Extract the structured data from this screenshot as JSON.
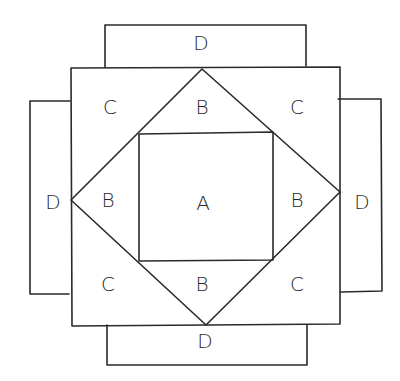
{
  "diagram": {
    "type": "quilt-block-layout",
    "labels": {
      "center": "A",
      "diamond_top": "B",
      "diamond_right": "B",
      "diamond_bottom": "B",
      "diamond_left": "B",
      "corner_top_left": "C",
      "corner_top_right": "C",
      "corner_bottom_left": "C",
      "corner_bottom_right": "C",
      "border_top": "D",
      "border_right": "D",
      "border_bottom": "D",
      "border_left": "D"
    },
    "line_color": "#2a2a2a"
  }
}
